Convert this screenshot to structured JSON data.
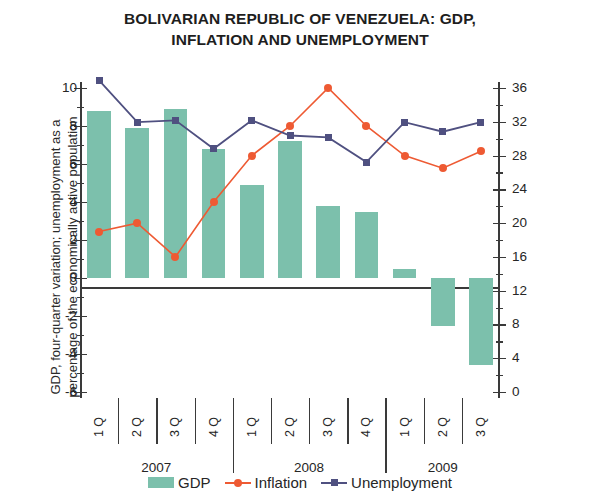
{
  "title": {
    "line1": "BOLIVARIAN REPUBLIC OF VENEZUELA: GDP,",
    "line2": "INFLATION AND UNEMPLOYMENT"
  },
  "axes": {
    "left_title": "GDP, four-quarter variation; unemployment as a percentage of the economically active population",
    "right_title": "Inflation, 12-month variation"
  },
  "legend": {
    "gdp": "GDP",
    "inflation": "Inflation",
    "unemployment": "Unemployment"
  },
  "colors": {
    "gdp": "#7cc0ac",
    "inflation": "#ee5a33",
    "unemployment": "#4f5080",
    "axis": "#3a3a3a"
  },
  "chart_data": {
    "type": "bar",
    "title": "BOLIVARIAN REPUBLIC OF VENEZUELA: GDP, INFLATION AND UNEMPLOYMENT",
    "xlabel": "",
    "ylabel": "GDP, four-quarter variation; unemployment as a percentage of the economically active population",
    "y2label": "Inflation, 12-month variation",
    "ylim": [
      -6,
      10
    ],
    "y2lim": [
      0,
      36
    ],
    "yticks": [
      -6,
      -4,
      -2,
      0,
      2,
      4,
      6,
      8,
      10
    ],
    "ytick_labels": [
      "-6",
      "-4",
      "-2",
      "0",
      "2",
      "4",
      "6",
      "8",
      "10"
    ],
    "y2ticks": [
      0,
      4,
      8,
      12,
      16,
      20,
      24,
      28,
      32,
      36
    ],
    "y2tick_labels": [
      "0",
      "4",
      "8",
      "12",
      "16",
      "20",
      "24",
      "28",
      "32",
      "36"
    ],
    "grid": false,
    "legend_position": "bottom",
    "categories": [
      "1 Q",
      "2 Q",
      "3 Q",
      "4 Q",
      "1 Q",
      "2 Q",
      "3 Q",
      "4 Q",
      "1 Q",
      "2 Q",
      "3 Q"
    ],
    "year_groups": [
      {
        "label": "2007",
        "quarters": [
          "1 Q",
          "2 Q",
          "3 Q",
          "4 Q"
        ]
      },
      {
        "label": "2008",
        "quarters": [
          "1 Q",
          "2 Q",
          "3 Q",
          "4 Q"
        ]
      },
      {
        "label": "2009",
        "quarters": [
          "1 Q",
          "2 Q",
          "3 Q"
        ]
      }
    ],
    "series": [
      {
        "name": "GDP",
        "type": "bar",
        "axis": "left",
        "color": "#7cc0ac",
        "values": [
          8.8,
          7.9,
          8.9,
          6.8,
          4.9,
          7.2,
          3.8,
          3.5,
          0.5,
          -2.5,
          -4.6
        ]
      },
      {
        "name": "Inflation",
        "type": "line",
        "axis": "right",
        "color": "#ee5a33",
        "marker": "circle",
        "values": [
          19.0,
          20.0,
          16.0,
          22.5,
          28.0,
          31.5,
          36.0,
          31.5,
          28.0,
          26.5,
          28.5
        ]
      },
      {
        "name": "Unemployment",
        "type": "line",
        "axis": "left",
        "color": "#4f5080",
        "marker": "square",
        "values": [
          10.4,
          8.2,
          8.3,
          6.8,
          8.3,
          7.5,
          7.4,
          6.1,
          8.2,
          7.7,
          8.2
        ]
      }
    ]
  }
}
